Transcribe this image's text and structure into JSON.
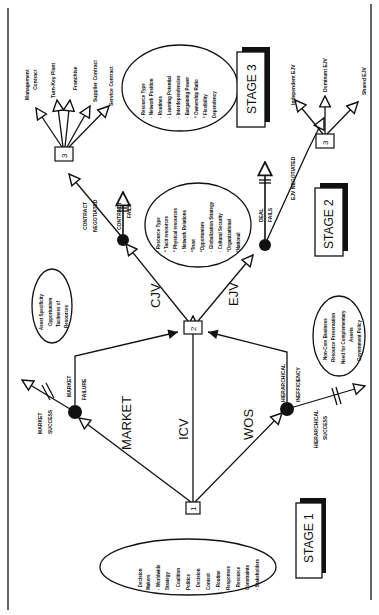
{
  "stages": {
    "stage1": "STAGE 1",
    "stage2": "STAGE 2",
    "stage3": "STAGE 3"
  },
  "nodes": {
    "n1": "1",
    "n2": "2",
    "n3a": "3",
    "n3b": "3"
  },
  "paths": {
    "market": "MARKET",
    "icv": "ICV",
    "wos": "WOS",
    "cjv": "CJV",
    "ejv": "EJV"
  },
  "outcomes": {
    "market_success_1": "MARKET",
    "market_success_2": "SUCCESS",
    "market_failure_1": "MARKET",
    "market_failure_2": "FAILURE",
    "hier_success_1": "HIERARCHICAL",
    "hier_success_2": "SUCCESS",
    "hier_ineff_1": "HIERARCHICAL",
    "hier_ineff_2": "INEFFICIENCY",
    "contract_neg_1": "CONTRACT",
    "contract_neg_2": "NEGOTIATED",
    "contract_fails_1": "CONTRACT",
    "contract_fails_2": "FAILS",
    "deal_fails_1": "DEAL",
    "deal_fails_2": "FAILS",
    "ejv_negotiated": "EJV NEGOTIATED"
  },
  "stage1_factors": [
    "· Decision",
    "  Makers",
    "· Worldwide",
    "  Strategy",
    "· Coalition",
    "  Politics",
    "· Decision",
    "  Context",
    "· Routine",
    "  Responses",
    "· Resource",
    "  Constraints",
    "· Stakeholders"
  ],
  "market_failure_factors": [
    "Asset Specificity",
    "Opportunism",
    "Tacitness of",
    "Resources"
  ],
  "hier_ineff_factors": [
    "Non-Core Business",
    "Resource Preservation",
    "Need for Complementary",
    "Assets",
    "Government Policy"
  ],
  "stage2_factors": [
    "· Resource Type",
    "  * Tacit resources",
    "  * Physical resources",
    "· Network Relations",
    "  *Trust",
    "  *Opportunism",
    "· Globalization Strategy",
    "· Cultural Security",
    "  *Organizational",
    "  *National"
  ],
  "stage3_factors": [
    "· Resource Type",
    "· Network Position",
    "· Routines",
    "· Learning Potential",
    "· Interdependencies",
    "· Bargaining Power",
    "* Ownership Ratio",
    "* Flexibility",
    "  Dependency"
  ],
  "contract_types": [
    "Management Contract",
    "Turn-Key Plant",
    "Franchise",
    "Supplier Contract",
    "Service Contract"
  ],
  "ejv_types": [
    "Independent EJV",
    "Dominant EJV",
    "Shared EJV"
  ]
}
